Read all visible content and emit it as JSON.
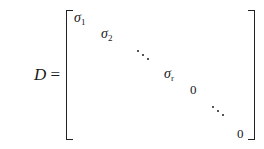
{
  "equation": {
    "lhs_variable": "D",
    "equals": "=",
    "matrix": {
      "type": "diagonal",
      "bracket_style": "square",
      "diagonal_entries": [
        {
          "symbol": "σ",
          "subscript": "1"
        },
        {
          "symbol": "σ",
          "subscript": "2"
        },
        {
          "ellipsis": "⋱"
        },
        {
          "symbol": "σ",
          "subscript": "r"
        },
        {
          "value": "0"
        },
        {
          "ellipsis": "⋱"
        },
        {
          "value": "0"
        }
      ]
    }
  }
}
